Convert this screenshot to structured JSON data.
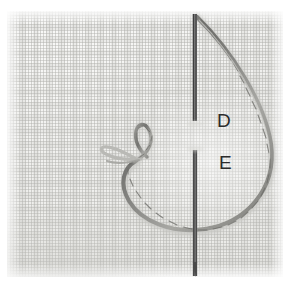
{
  "image": {
    "subject": "embroidery-needle-and-thread-loop-on-linen",
    "width": 293,
    "height": 288,
    "background_color": "#ffffff"
  },
  "fabric": {
    "name": "woven linen swatch",
    "base_color": "#f2f2f0",
    "thread_grid_color": "#b0b0ac",
    "shadow_color": "#e9e9e6",
    "bounds": {
      "x": 7,
      "y": 11,
      "width": 276,
      "height": 266
    }
  },
  "needle": {
    "name": "sewing needle",
    "color": "#3b3b3b",
    "highlight_color": "#8f8f8f",
    "x": 195,
    "top_y": 14,
    "bottom_y": 276,
    "upper_segment": {
      "from_y": 14,
      "to_y": 121
    },
    "lower_segment": {
      "from_y": 150,
      "to_y": 276
    }
  },
  "thread": {
    "name": "twisted embroidery thread loop",
    "color": "#8b8b87",
    "shadow_color": "#6f6f6b",
    "highlight_color": "#d8d8d4"
  },
  "labels": [
    {
      "id": "D",
      "text": "D",
      "x": 217,
      "y": 111,
      "color": "#2b2b2b"
    },
    {
      "id": "E",
      "text": "E",
      "x": 219,
      "y": 153,
      "color": "#2b2b2b"
    }
  ]
}
